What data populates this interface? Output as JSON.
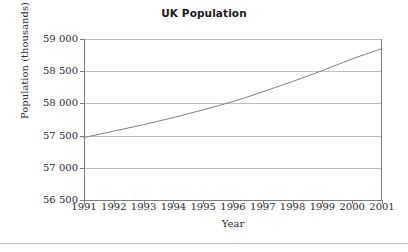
{
  "chart_data": {
    "type": "line",
    "title": "UK Population",
    "xlabel": "Year",
    "ylabel": "Population (thousands)",
    "x": [
      1991,
      1992,
      1993,
      1994,
      1995,
      1996,
      1997,
      1998,
      1999,
      2000,
      2001
    ],
    "xtick_labels": [
      "1991",
      "1992",
      "1993",
      "1994",
      "1995",
      "1996",
      "1997",
      "1998",
      "1999",
      "2000",
      "2001"
    ],
    "values": [
      57470,
      57570,
      57670,
      57780,
      57900,
      58030,
      58180,
      58340,
      58510,
      58690,
      58850
    ],
    "series": [
      {
        "name": "UK Population",
        "values": [
          57470,
          57570,
          57670,
          57780,
          57900,
          58030,
          58180,
          58340,
          58510,
          58690,
          58850
        ]
      }
    ],
    "ylim": [
      56500,
      59000
    ],
    "xlim": [
      1991,
      2001
    ],
    "yticks": [
      56500,
      57000,
      57500,
      58000,
      58500,
      59000
    ],
    "ytick_labels": [
      "56 500",
      "57 000",
      "57 500",
      "58 000",
      "58 500",
      "59 000"
    ],
    "grid": "horizontal",
    "legend": "none",
    "line_color": "#808080",
    "grid_color": "#bfbfbf",
    "axis_color": "#7d7d7d",
    "background": "#ffffff"
  }
}
